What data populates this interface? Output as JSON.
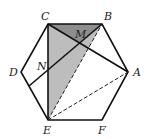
{
  "diagram": {
    "type": "geometry",
    "shape": "regular hexagon",
    "vertices": {
      "A": {
        "label": "A",
        "x": 128,
        "y": 72
      },
      "B": {
        "label": "B",
        "x": 102,
        "y": 24
      },
      "C": {
        "label": "C",
        "x": 48,
        "y": 24
      },
      "D": {
        "label": "D",
        "x": 21,
        "y": 72
      },
      "E": {
        "label": "E",
        "x": 48,
        "y": 120
      },
      "F": {
        "label": "F",
        "x": 102,
        "y": 120
      }
    },
    "points": {
      "M": {
        "label": "M"
      },
      "N": {
        "label": "N"
      }
    },
    "segments_solid": [
      "CE",
      "CA",
      "DB",
      "EA? no",
      "BA"
    ],
    "segments_dashed": [
      "EB",
      "EA"
    ],
    "shaded_triangle": "CBE",
    "colors": {
      "line": "#111111",
      "shade": "#b8b8b8",
      "shade_dark": "#8c8c8c"
    }
  }
}
